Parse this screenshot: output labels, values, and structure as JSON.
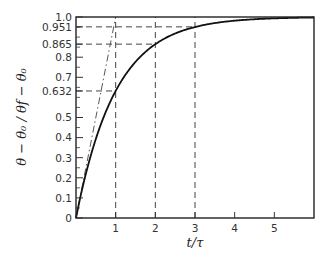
{
  "chart_data": {
    "type": "line",
    "title": "",
    "xlabel": "t/τ",
    "ylabel": "θ − θ₀ / θf − θ₀",
    "xlim": [
      0,
      6
    ],
    "ylim": [
      0,
      1.0
    ],
    "grid": false,
    "x_ticks": [
      {
        "value": 1,
        "label": "1"
      },
      {
        "value": 2,
        "label": "2"
      },
      {
        "value": 3,
        "label": "3"
      },
      {
        "value": 4,
        "label": "4"
      },
      {
        "value": 5,
        "label": "5"
      }
    ],
    "y_ticks": [
      {
        "value": 0,
        "label": "0"
      },
      {
        "value": 0.1,
        "label": "0.1"
      },
      {
        "value": 0.2,
        "label": "0.2"
      },
      {
        "value": 0.3,
        "label": "0.3"
      },
      {
        "value": 0.4,
        "label": "0.4"
      },
      {
        "value": 0.5,
        "label": "0.5"
      },
      {
        "value": 0.632,
        "label": "0.632"
      },
      {
        "value": 0.7,
        "label": "0.7"
      },
      {
        "value": 0.8,
        "label": "0.8"
      },
      {
        "value": 0.865,
        "label": "0.865"
      },
      {
        "value": 0.951,
        "label": "0.951"
      },
      {
        "value": 1.0,
        "label": "1.0"
      }
    ],
    "series": [
      {
        "name": "response",
        "style": "solid",
        "formula": "1 - exp(-t/τ)",
        "x": [
          0,
          0.25,
          0.5,
          0.75,
          1,
          1.5,
          2,
          2.5,
          3,
          3.5,
          4,
          4.5,
          5,
          5.5,
          6
        ],
        "y": [
          0,
          0.221,
          0.393,
          0.528,
          0.632,
          0.777,
          0.865,
          0.918,
          0.951,
          0.97,
          0.982,
          0.989,
          0.993,
          0.996,
          0.998
        ]
      },
      {
        "name": "initial-tangent",
        "style": "dash",
        "x": [
          0,
          1
        ],
        "y": [
          0,
          1.0
        ]
      }
    ],
    "reference_lines": [
      {
        "x": 1,
        "y": 0.632,
        "style": "dash"
      },
      {
        "x": 2,
        "y": 0.865,
        "style": "dash"
      },
      {
        "x": 3,
        "y": 0.951,
        "style": "dash"
      }
    ],
    "minor_y_ticks": [
      0.05,
      0.15,
      0.25,
      0.35,
      0.45,
      0.55,
      0.6,
      0.65,
      0.75,
      0.85,
      0.9,
      0.95
    ]
  }
}
